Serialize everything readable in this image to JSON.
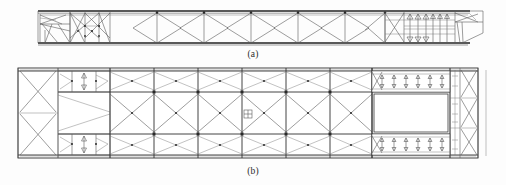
{
  "figure": {
    "kind": "engineering-line-drawing",
    "background_color": "#fdfdfd",
    "line_color": "#555555",
    "heavy_line_color": "#2e2e2e"
  },
  "panels": [
    {
      "id": "a",
      "caption": "(a)",
      "view": "side elevation",
      "box": {
        "x": 38,
        "y": 9,
        "width": 445,
        "height": 37
      },
      "top_chord_y": 12,
      "bottom_chord_y": 43,
      "mid_chord_y": 27,
      "left_detail": {
        "x": 38,
        "width": 32,
        "type": "end-bay-with-diagonals"
      },
      "xbrace_cluster": {
        "x": 70,
        "width": 38,
        "type": "double-cross-panel"
      },
      "repeating_bays": {
        "start_x": 110,
        "end_x": 385,
        "count": 6,
        "pattern": "vertical-post-with-inverted-V-and-V-diagonals"
      },
      "dense_right_zone": {
        "x": 385,
        "width": 70,
        "type": "closely-spaced-verticals-and-triangles"
      },
      "right_taper": {
        "x": 455,
        "width": 28,
        "type": "tapered-nose-end"
      }
    },
    {
      "id": "b",
      "caption": "(b)",
      "view": "plan view",
      "box": {
        "x": 18,
        "y": 68,
        "width": 460,
        "height": 90
      },
      "rail_ys": [
        71,
        92,
        134,
        155
      ],
      "left_end_xbraces": {
        "x": 18,
        "width": 40,
        "count": 2
      },
      "left_detail_bays": {
        "x": 58,
        "width": 52,
        "type": "paired-arrow-bays"
      },
      "central_lattice": {
        "start_x": 110,
        "end_x": 372,
        "bay_count": 6,
        "pattern": "diamond-cross-bracing-top-and-bottom-strips-with-large-X-in-middle"
      },
      "hatch_opening": {
        "x": 372,
        "y": 95,
        "width": 78,
        "height": 38,
        "fill": "#ffffff"
      },
      "hatch_strips": {
        "type": "dense-stiffener-strip",
        "count": 2
      },
      "right_end_xbraces": {
        "x": 450,
        "width": 28,
        "count": 3
      },
      "center_marker": {
        "x": 248,
        "y": 114,
        "symbol": "square-node-marker"
      }
    }
  ],
  "captions": {
    "a": "(a)",
    "b": "(b)"
  }
}
